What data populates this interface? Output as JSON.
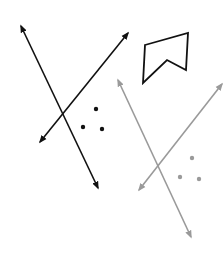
{
  "canvas": {
    "width": 224,
    "height": 256,
    "background": "#ffffff"
  },
  "colors": {
    "black": "#111111",
    "gray": "#9a9a9a"
  },
  "black_group": {
    "lines": [
      {
        "id": "black-line-1",
        "x1": 21,
        "y1": 26,
        "x2": 98,
        "y2": 188,
        "arrows": "both"
      },
      {
        "id": "black-line-2",
        "x1": 128,
        "y1": 33,
        "x2": 40,
        "y2": 142,
        "arrows": "both"
      }
    ],
    "dots": [
      {
        "cx": 96,
        "cy": 109
      },
      {
        "cx": 83,
        "cy": 127
      },
      {
        "cx": 102,
        "cy": 129
      }
    ]
  },
  "gray_group": {
    "lines": [
      {
        "id": "gray-line-1",
        "x1": 118,
        "y1": 80,
        "x2": 191,
        "y2": 237,
        "arrows": "both"
      },
      {
        "id": "gray-line-2",
        "x1": 222,
        "y1": 84,
        "x2": 139,
        "y2": 190,
        "arrows": "both"
      }
    ],
    "dots": [
      {
        "cx": 192,
        "cy": 158
      },
      {
        "cx": 180,
        "cy": 177
      },
      {
        "cx": 199,
        "cy": 179
      }
    ]
  },
  "polygon": {
    "points": "145,45 188,33 186,70 167,60 143,83",
    "stroke": "#111111"
  }
}
